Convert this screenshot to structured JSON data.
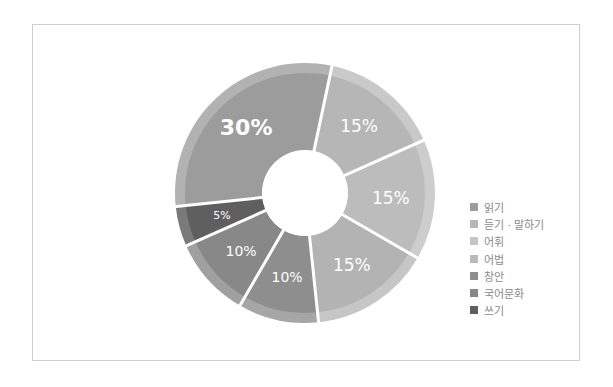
{
  "chart_data": {
    "type": "pie",
    "variant": "donut",
    "title": "",
    "start_angle_deg": 264,
    "direction": "clockwise",
    "slices": [
      {
        "name": "읽기",
        "value": 30,
        "label": "30%",
        "color": "#9c9c9c",
        "band_color": "#b2b2b2",
        "label_size": "large"
      },
      {
        "name": "듣기 · 말하기",
        "value": 15,
        "label": "15%",
        "color": "#b6b6b6",
        "band_color": "#c9c9c9",
        "label_size": "medium"
      },
      {
        "name": "어휘",
        "value": 15,
        "label": "15%",
        "color": "#bcbcbc",
        "band_color": "#cdcdcd",
        "label_size": "medium"
      },
      {
        "name": "어법",
        "value": 15,
        "label": "15%",
        "color": "#b3b3b3",
        "band_color": "#c6c6c6",
        "label_size": "medium"
      },
      {
        "name": "창안",
        "value": 10,
        "label": "10%",
        "color": "#8e8e8e",
        "band_color": "#a6a6a6",
        "label_size": "small"
      },
      {
        "name": "국어문화",
        "value": 10,
        "label": "10%",
        "color": "#888888",
        "band_color": "#a0a0a0",
        "label_size": "small"
      },
      {
        "name": "쓰기",
        "value": 5,
        "label": "5%",
        "color": "#5f5f5f",
        "band_color": "#7a7a7a",
        "label_size": "xsmall"
      }
    ],
    "legend_position": "right"
  },
  "legend": {
    "items": [
      {
        "label": "읽기",
        "color": "#9c9c9c"
      },
      {
        "label": "듣기 · 말하기",
        "color": "#b6b6b6"
      },
      {
        "label": "어휘",
        "color": "#c4c4c4"
      },
      {
        "label": "어법",
        "color": "#bababa"
      },
      {
        "label": "창안",
        "color": "#8e8e8e"
      },
      {
        "label": "국어문화",
        "color": "#888888"
      },
      {
        "label": "쓰기",
        "color": "#5f5f5f"
      }
    ]
  }
}
